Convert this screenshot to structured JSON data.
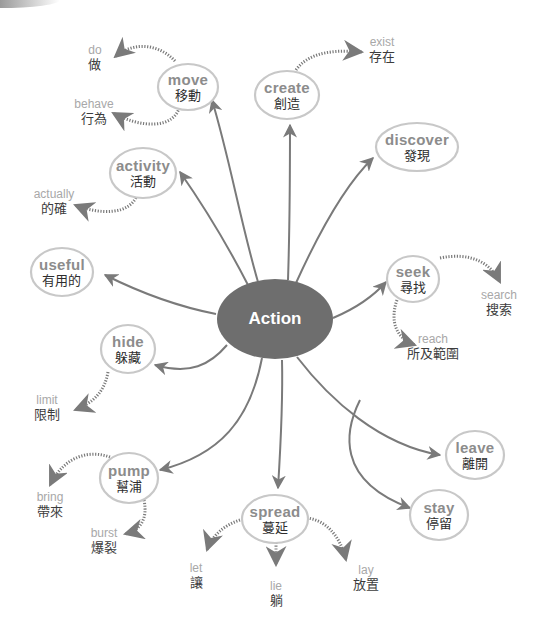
{
  "colors": {
    "center_fill": "#6e6e6e",
    "edge": "#7a7a7a",
    "node_outline": "#c8c8c8",
    "node_en_text": "#8c8c8c",
    "zh_text": "#2e2e2e",
    "leaf_en_text": "#a8a8a8"
  },
  "center": {
    "label": "Action"
  },
  "nodes": [
    {
      "id": "move",
      "en": "move",
      "zh": "移動"
    },
    {
      "id": "create",
      "en": "create",
      "zh": "創造"
    },
    {
      "id": "discover",
      "en": "discover",
      "zh": "發現"
    },
    {
      "id": "activity",
      "en": "activity",
      "zh": "活動"
    },
    {
      "id": "useful",
      "en": "useful",
      "zh": "有用的"
    },
    {
      "id": "seek",
      "en": "seek",
      "zh": "尋找"
    },
    {
      "id": "hide",
      "en": "hide",
      "zh": "躲藏"
    },
    {
      "id": "leave",
      "en": "leave",
      "zh": "離開"
    },
    {
      "id": "pump",
      "en": "pump",
      "zh": "幫浦"
    },
    {
      "id": "spread",
      "en": "spread",
      "zh": "蔓延"
    },
    {
      "id": "stay",
      "en": "stay",
      "zh": "停留"
    }
  ],
  "leaves": [
    {
      "parent": "move",
      "en": "do",
      "zh": "做"
    },
    {
      "parent": "move",
      "en": "behave",
      "zh": "行為"
    },
    {
      "parent": "create",
      "en": "exist",
      "zh": "存在"
    },
    {
      "parent": "activity",
      "en": "actually",
      "zh": "的確"
    },
    {
      "parent": "seek",
      "en": "search",
      "zh": "搜索"
    },
    {
      "parent": "seek",
      "en": "reach",
      "zh": "所及範圍"
    },
    {
      "parent": "hide",
      "en": "limit",
      "zh": "限制"
    },
    {
      "parent": "pump",
      "en": "bring",
      "zh": "帶來"
    },
    {
      "parent": "pump",
      "en": "burst",
      "zh": "爆裂"
    },
    {
      "parent": "spread",
      "en": "let",
      "zh": "讓"
    },
    {
      "parent": "spread",
      "en": "lie",
      "zh": "躺"
    },
    {
      "parent": "spread",
      "en": "lay",
      "zh": "放置"
    }
  ]
}
